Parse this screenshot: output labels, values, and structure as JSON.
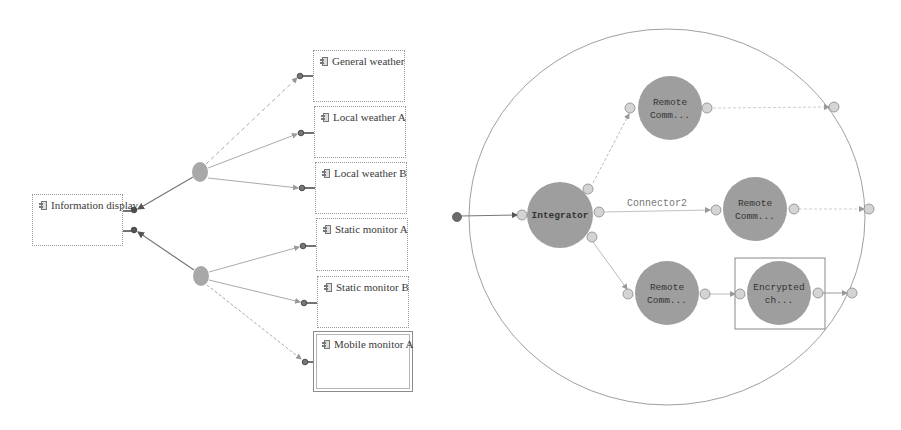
{
  "left_diagram": {
    "source": {
      "label": "Information display",
      "icon": "component-icon"
    },
    "hubs": [
      {
        "id": "hub-weather",
        "color": "#a8a8a8"
      },
      {
        "id": "hub-monitor",
        "color": "#a8a8a8"
      }
    ],
    "targets": [
      {
        "label": "General weather",
        "icon": "component-icon",
        "link": "dashed"
      },
      {
        "label": "Local weather A",
        "icon": "component-icon",
        "link": "solid"
      },
      {
        "label": "Local weather B",
        "icon": "component-icon",
        "link": "solid"
      },
      {
        "label": "Static monitor A",
        "icon": "component-icon",
        "link": "solid"
      },
      {
        "label": "Static monitor B",
        "icon": "component-icon",
        "link": "solid"
      },
      {
        "label": "Mobile monitor A",
        "icon": "component-icon",
        "link": "dashed",
        "selected": true
      }
    ]
  },
  "right_diagram": {
    "container": "circle-boundary",
    "nodes": {
      "integrator": "Integrator",
      "remote_top_l1": "Remote",
      "remote_top_l2": "Comm...",
      "remote_mid_l1": "Remote",
      "remote_mid_l2": "Comm...",
      "remote_bot_l1": "Remote",
      "remote_bot_l2": "Comm...",
      "encrypted_l1": "Encrypted",
      "encrypted_l2": "ch..."
    },
    "connector_label": "Connector2",
    "colors": {
      "node_fill": "#9e9e9e",
      "port_fill": "#d4d4d4",
      "entry_port": "#6b6b6b",
      "line": "#b0b0b0"
    }
  }
}
